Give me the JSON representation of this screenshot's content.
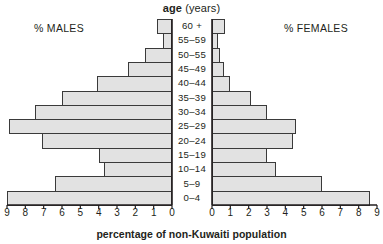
{
  "chart_data": {
    "type": "bar",
    "subtype": "population-pyramid",
    "title": "age (years)",
    "title_bold_word": "age",
    "title_rest": "(years)",
    "xlabel": "percentage of non-Kuwaiti population",
    "ylabel": "age (years)",
    "left_panel_label": "% MALES",
    "right_panel_label": "% FEMALES",
    "categories": [
      "0–4",
      "5–9",
      "10–14",
      "15–19",
      "20–24",
      "25–29",
      "30–34",
      "35–39",
      "40–44",
      "45–49",
      "50–55",
      "55–59",
      "60 +"
    ],
    "xlim": [
      0,
      9
    ],
    "xticks": [
      0,
      1,
      2,
      3,
      4,
      5,
      6,
      7,
      8,
      9
    ],
    "left_tick_labels": [
      "9",
      "8",
      "7",
      "6",
      "5",
      "4",
      "3",
      "2",
      "1",
      "0"
    ],
    "right_tick_labels": [
      "0",
      "1",
      "2",
      "3",
      "4",
      "5",
      "6",
      "7",
      "8",
      "9"
    ],
    "grid": false,
    "legend": "none",
    "series": [
      {
        "name": "% MALES",
        "side": "left",
        "values": [
          9.0,
          6.4,
          3.7,
          4.0,
          7.1,
          8.9,
          7.5,
          6.0,
          4.1,
          2.4,
          1.5,
          0.5,
          0.8
        ]
      },
      {
        "name": "% FEMALES",
        "side": "right",
        "values": [
          8.6,
          6.0,
          3.5,
          3.0,
          4.4,
          4.6,
          3.0,
          2.1,
          1.0,
          0.65,
          0.45,
          0.3,
          0.7
        ]
      }
    ],
    "colors": {
      "bar_fill": "#e2e2e2",
      "bar_stroke": "#3a3a3a",
      "axis": "#231f20",
      "text": "#231f20",
      "background": "#ffffff"
    }
  }
}
